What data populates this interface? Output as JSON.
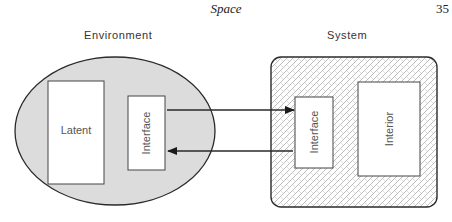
{
  "page": {
    "running_head": "Space",
    "page_number": "35"
  },
  "diagram": {
    "environment": {
      "label": "Environment",
      "latent_label": "Latent",
      "interface_label": "Interface"
    },
    "system": {
      "label": "System",
      "interface_label": "Interface",
      "interior_label": "Interior"
    },
    "arrows": [
      {
        "from": "environment.interface",
        "to": "system.interface"
      },
      {
        "from": "system.interface",
        "to": "environment.interface"
      }
    ],
    "colors": {
      "environment_fill": "#dcdcdc",
      "stroke": "#2a2a2a",
      "box_fill": "#ffffff",
      "system_pattern": "#b8b8b8"
    }
  }
}
